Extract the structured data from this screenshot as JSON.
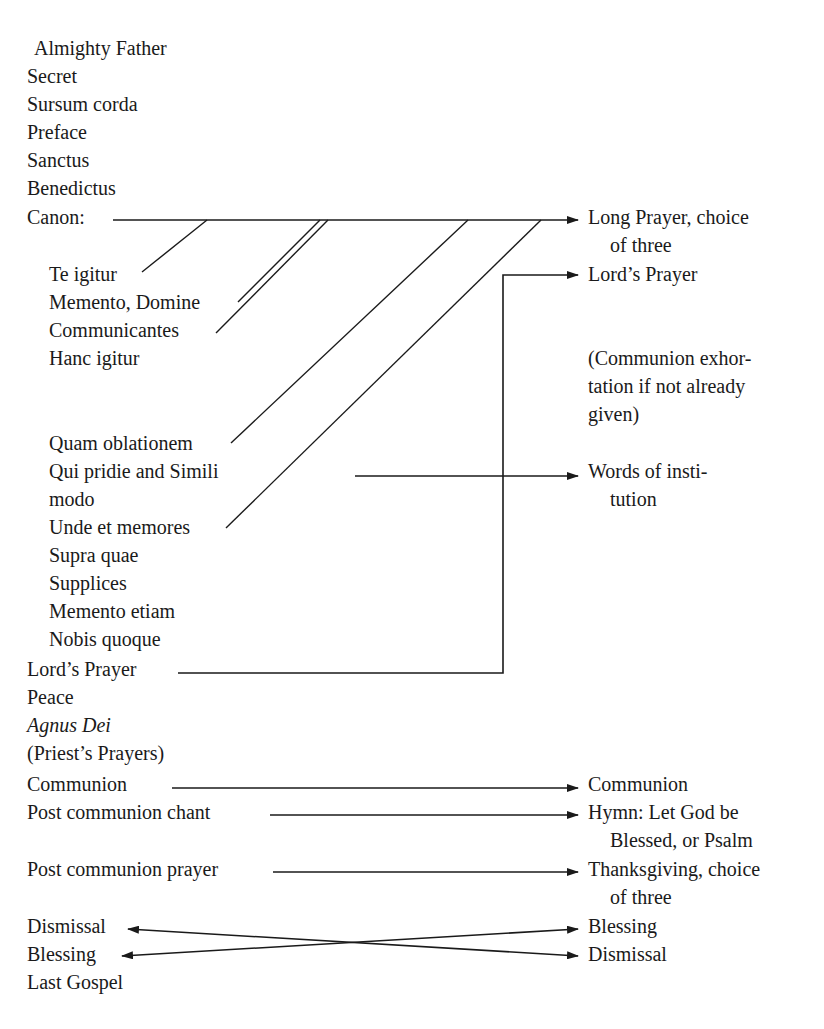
{
  "left_column": {
    "items": [
      {
        "label": "Almighty Father",
        "x": 34,
        "y": 36
      },
      {
        "label": "Secret",
        "x": 27,
        "y": 64
      },
      {
        "label": "Sursum corda",
        "x": 27,
        "y": 92
      },
      {
        "label": "Preface",
        "x": 27,
        "y": 120
      },
      {
        "label": "Sanctus",
        "x": 27,
        "y": 148
      },
      {
        "label": "Benedictus",
        "x": 27,
        "y": 176
      },
      {
        "label": "Canon:",
        "x": 27,
        "y": 205
      }
    ],
    "canon_parts": [
      {
        "label": "Te igitur",
        "x": 49,
        "y": 262
      },
      {
        "label": "Memento, Domine",
        "x": 49,
        "y": 290
      },
      {
        "label": "Communicantes",
        "x": 49,
        "y": 318
      },
      {
        "label": "Hanc igitur",
        "x": 49,
        "y": 346
      },
      {
        "label": "Quam oblationem",
        "x": 49,
        "y": 431
      },
      {
        "label": "Qui pridie and Simili",
        "x": 49,
        "y": 459
      },
      {
        "label": "modo",
        "x": 49,
        "y": 487
      },
      {
        "label": "Unde et memores",
        "x": 49,
        "y": 515
      },
      {
        "label": "Supra quae",
        "x": 49,
        "y": 543
      },
      {
        "label": "Supplices",
        "x": 49,
        "y": 571
      },
      {
        "label": "Memento etiam",
        "x": 49,
        "y": 599
      },
      {
        "label": "Nobis quoque",
        "x": 49,
        "y": 627
      }
    ],
    "after_canon": [
      {
        "label": "Lord’s Prayer",
        "x": 27,
        "y": 657
      },
      {
        "label": "Peace",
        "x": 27,
        "y": 685
      },
      {
        "label": "Agnus Dei",
        "x": 27,
        "y": 713,
        "italic": true
      },
      {
        "label": "(Priest’s Prayers)",
        "x": 27,
        "y": 741
      },
      {
        "label": "Communion",
        "x": 27,
        "y": 772
      },
      {
        "label": "Post communion chant",
        "x": 27,
        "y": 800
      },
      {
        "label": "Post communion prayer",
        "x": 27,
        "y": 857
      },
      {
        "label": "Dismissal",
        "x": 27,
        "y": 914
      },
      {
        "label": "Blessing",
        "x": 27,
        "y": 942
      },
      {
        "label": "Last Gospel",
        "x": 27,
        "y": 970
      }
    ]
  },
  "right_column": {
    "items": [
      {
        "label": "Long Prayer, choice",
        "x": 588,
        "y": 205
      },
      {
        "label": "of three",
        "x": 610,
        "y": 233
      },
      {
        "label": "Lord’s Prayer",
        "x": 588,
        "y": 262
      },
      {
        "label": "(Communion exhor-",
        "x": 588,
        "y": 346
      },
      {
        "label": "tation if not already",
        "x": 588,
        "y": 374
      },
      {
        "label": "given)",
        "x": 588,
        "y": 402
      },
      {
        "label": "Words of insti-",
        "x": 588,
        "y": 459
      },
      {
        "label": "tution",
        "x": 610,
        "y": 487
      },
      {
        "label": "Communion",
        "x": 588,
        "y": 772
      },
      {
        "label": "Hymn: Let God be",
        "x": 588,
        "y": 800
      },
      {
        "label": "Blessed, or Psalm",
        "x": 610,
        "y": 828
      },
      {
        "label": "Thanksgiving, choice",
        "x": 588,
        "y": 857
      },
      {
        "label": "of three",
        "x": 610,
        "y": 885
      },
      {
        "label": "Blessing",
        "x": 588,
        "y": 914
      },
      {
        "label": "Dismissal",
        "x": 588,
        "y": 942
      }
    ]
  },
  "connectors": {
    "stroke_color": "#1a1a1a",
    "arrows": [
      {
        "name": "canon-to-long-prayer",
        "points": "113,220 578,220",
        "head": "end"
      },
      {
        "name": "lords-prayer-return",
        "points": "178,673 503,673 503,275 578,275",
        "head": "end"
      },
      {
        "name": "qui-pridie-to-words-of-institution",
        "points": "355,476 578,476",
        "head": "end"
      },
      {
        "name": "communion-to-communion",
        "points": "172,788 578,788",
        "head": "end"
      },
      {
        "name": "chant-to-hymn",
        "points": "270,815 578,815",
        "head": "end"
      },
      {
        "name": "prayer-to-thanksgiving",
        "points": "273,872 578,872",
        "head": "end"
      },
      {
        "name": "dismissal-to-dismissal",
        "points": "128,929 578,956",
        "head": "both"
      },
      {
        "name": "blessing-to-blessing",
        "points": "122,956 578,929",
        "head": "both"
      }
    ],
    "diagonals": [
      {
        "name": "te-igitur-link",
        "x1": 207,
        "y1": 220,
        "x2": 142,
        "y2": 272
      },
      {
        "name": "memento-domine-link",
        "x1": 320,
        "y1": 220,
        "x2": 238,
        "y2": 302
      },
      {
        "name": "communicantes-link",
        "x1": 328,
        "y1": 220,
        "x2": 216,
        "y2": 333
      },
      {
        "name": "quam-oblationem-link",
        "x1": 468,
        "y1": 220,
        "x2": 231,
        "y2": 443
      },
      {
        "name": "unde-et-memores-link",
        "x1": 541,
        "y1": 220,
        "x2": 226,
        "y2": 528
      }
    ]
  }
}
